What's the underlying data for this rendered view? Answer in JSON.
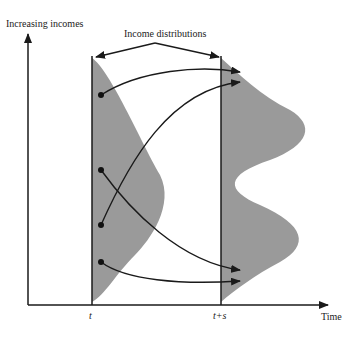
{
  "diagram": {
    "y_axis_label": "Increasing incomes",
    "x_axis_label": "Time",
    "top_label": "Income distributions",
    "time_marks": [
      "t",
      "t+s"
    ],
    "colors": {
      "fill": "#9a9a9a",
      "line": "#1a1a1a"
    },
    "transitions": [
      {
        "from_y": 95,
        "to_y": 70
      },
      {
        "from_y": 170,
        "to_y": 270
      },
      {
        "from_y": 225,
        "to_y": 80
      },
      {
        "from_y": 262,
        "to_y": 283
      }
    ]
  }
}
